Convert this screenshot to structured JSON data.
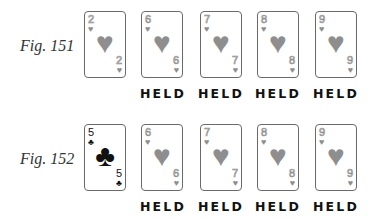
{
  "figures": [
    {
      "label": "Fig. 151",
      "cards": [
        {
          "rank": "2",
          "suit": "♥",
          "suit_name": "hearts",
          "style": "faded",
          "held": false
        },
        {
          "rank": "6",
          "suit": "♥",
          "suit_name": "hearts",
          "style": "faded",
          "held": true
        },
        {
          "rank": "7",
          "suit": "♥",
          "suit_name": "hearts",
          "style": "faded",
          "held": true
        },
        {
          "rank": "8",
          "suit": "♥",
          "suit_name": "hearts",
          "style": "faded",
          "held": true
        },
        {
          "rank": "9",
          "suit": "♥",
          "suit_name": "hearts",
          "style": "faded",
          "held": true
        }
      ]
    },
    {
      "label": "Fig. 152",
      "cards": [
        {
          "rank": "5",
          "suit": "♣",
          "suit_name": "clubs",
          "style": "dark",
          "held": false
        },
        {
          "rank": "6",
          "suit": "♥",
          "suit_name": "hearts",
          "style": "faded",
          "held": true
        },
        {
          "rank": "7",
          "suit": "♥",
          "suit_name": "hearts",
          "style": "faded",
          "held": true
        },
        {
          "rank": "8",
          "suit": "♥",
          "suit_name": "hearts",
          "style": "faded",
          "held": true
        },
        {
          "rank": "9",
          "suit": "♥",
          "suit_name": "hearts",
          "style": "faded",
          "held": true
        }
      ]
    }
  ],
  "held_label": "HELD",
  "colors": {
    "faded_card": "#8e8e8e",
    "dark_card": "#111111",
    "border": "#6a6a6a"
  }
}
